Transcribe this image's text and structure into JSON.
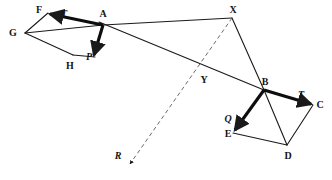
{
  "figure": {
    "kind": "vector-statics-diagram",
    "width": 332,
    "height": 180,
    "background_color": "#ffffff",
    "line_color": "#1a1a1a",
    "label_color": "#141414"
  },
  "labels": {
    "F": "F",
    "T_left": "T",
    "A": "A",
    "G": "G",
    "H": "H",
    "P_left": "P",
    "X": "X",
    "Y": "Y",
    "B": "B",
    "T_right": "T",
    "C": "C",
    "Q": "Q",
    "E": "E",
    "D": "D",
    "R": "R"
  },
  "points": {
    "F": {
      "x": 48,
      "y": 13
    },
    "G": {
      "x": 25,
      "y": 33
    },
    "H": {
      "x": 73,
      "y": 55
    },
    "A": {
      "x": 103,
      "y": 25
    },
    "Pend": {
      "x": 95,
      "y": 57
    },
    "X": {
      "x": 232,
      "y": 18
    },
    "Y": {
      "x": 202,
      "y": 73
    },
    "B": {
      "x": 264,
      "y": 90
    },
    "C": {
      "x": 313,
      "y": 105
    },
    "D": {
      "x": 287,
      "y": 145
    },
    "E": {
      "x": 233,
      "y": 133
    },
    "Rend": {
      "x": 130,
      "y": 164
    }
  },
  "label_positions": {
    "F": {
      "x": 39,
      "y": 10
    },
    "T_left": {
      "x": 64,
      "y": 14
    },
    "A": {
      "x": 103,
      "y": 14
    },
    "G": {
      "x": 13,
      "y": 33
    },
    "H": {
      "x": 70,
      "y": 66
    },
    "P_left": {
      "x": 89,
      "y": 57
    },
    "X": {
      "x": 233,
      "y": 10
    },
    "Y": {
      "x": 204,
      "y": 80
    },
    "B": {
      "x": 265,
      "y": 82
    },
    "T_right": {
      "x": 301,
      "y": 95
    },
    "C": {
      "x": 320,
      "y": 105
    },
    "Q": {
      "x": 228,
      "y": 119
    },
    "E": {
      "x": 228,
      "y": 134
    },
    "D": {
      "x": 288,
      "y": 156
    },
    "R": {
      "x": 118,
      "y": 156
    }
  },
  "segments": {
    "thin": [
      {
        "name": "F-G",
        "from": "F",
        "to": "G"
      },
      {
        "name": "G-H",
        "from": "G",
        "to": "H"
      },
      {
        "name": "H-Pend",
        "from": "H",
        "to": "Pend"
      },
      {
        "name": "G-A",
        "from": "G",
        "to": "A"
      },
      {
        "name": "A-X",
        "from": "A",
        "to": "X"
      },
      {
        "name": "A-B",
        "from": "A",
        "to": "B"
      },
      {
        "name": "X-B",
        "from": "X",
        "to": "B"
      },
      {
        "name": "B-D",
        "from": "B",
        "to": "D"
      },
      {
        "name": "C-D",
        "from": "C",
        "to": "D"
      },
      {
        "name": "E-D",
        "from": "E",
        "to": "D"
      }
    ],
    "thick_vectors": [
      {
        "name": "vector-T-at-A",
        "from": "A",
        "to": "F",
        "label": "T_left"
      },
      {
        "name": "vector-P-at-A",
        "from": "A",
        "to": "Pend",
        "label": "P_left"
      },
      {
        "name": "vector-T-at-B",
        "from": "B",
        "to": "C",
        "label": "T_right"
      },
      {
        "name": "vector-Q-at-B",
        "from": "B",
        "to": "E",
        "label": "Q"
      }
    ],
    "dashed": [
      {
        "name": "line-X-R-through-Y",
        "from": "X",
        "to": "Rend",
        "label": "R"
      }
    ]
  }
}
